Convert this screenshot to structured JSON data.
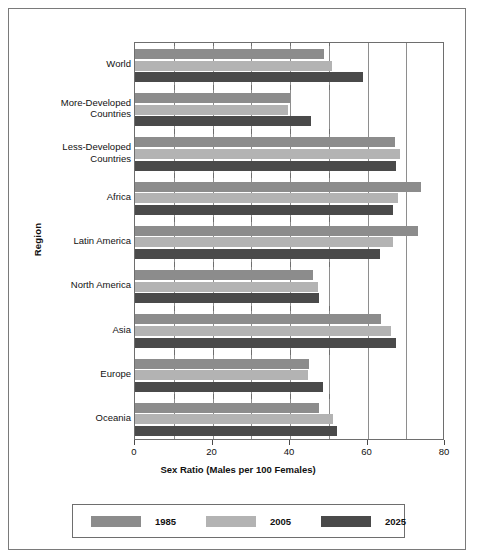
{
  "chart_data": {
    "type": "bar",
    "orientation": "horizontal",
    "title": "",
    "xlabel": "Sex Ratio (Males per 100 Females)",
    "ylabel": "Region",
    "xlim": [
      0,
      80
    ],
    "xticks": [
      0,
      20,
      40,
      60,
      80
    ],
    "xtick_labels": [
      "0",
      "20",
      "40",
      "60",
      "80"
    ],
    "minor_gridlines_every": 10,
    "grid": true,
    "legend_position": "bottom",
    "categories": [
      "World",
      "More-Developed Countries",
      "Less-Developed Countries",
      "Africa",
      "Latin America",
      "North America",
      "Asia",
      "Europe",
      "Oceania"
    ],
    "series": [
      {
        "name": "1985",
        "color": "#8c8c8c",
        "values": [
          48.7,
          40.1,
          67.0,
          73.9,
          73.1,
          45.9,
          63.6,
          45.0,
          47.4
        ]
      },
      {
        "name": "2005",
        "color": "#b3b3b3",
        "values": [
          50.8,
          39.6,
          68.3,
          67.9,
          66.6,
          47.3,
          66.1,
          44.6,
          51.0
        ]
      },
      {
        "name": "2025",
        "color": "#4a4a4a",
        "values": [
          58.8,
          45.3,
          67.4,
          66.6,
          63.1,
          47.6,
          67.4,
          48.4,
          52.1
        ]
      }
    ]
  },
  "legend": {
    "items": [
      {
        "label": "1985",
        "color": "#8c8c8c"
      },
      {
        "label": "2005",
        "color": "#b3b3b3"
      },
      {
        "label": "2025",
        "color": "#4a4a4a"
      }
    ]
  },
  "colors": {
    "frame": "#7a7a7a",
    "axis": "#6e6e6e",
    "gridline": "#8e8e8e",
    "text": "#111111",
    "background": "#ffffff"
  }
}
